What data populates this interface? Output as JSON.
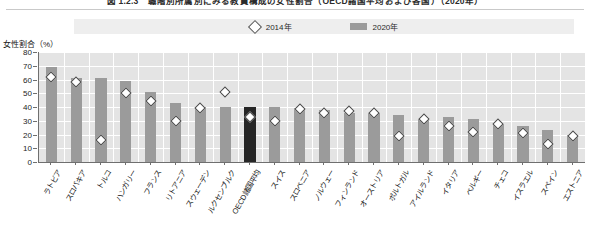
{
  "figure": {
    "title": "図 1.2.3　職階別所属別にみる教員構成の女性割合（OECD諸国平均および各国）（2020年）",
    "y_axis_title": "女性割合（%）"
  },
  "legend": {
    "position": "top-center",
    "items": [
      {
        "label": "2014年",
        "marker": "diamond-outline-icon",
        "color": "#ffffff"
      },
      {
        "label": "2020年",
        "marker": "bar-swatch-icon",
        "color": "#9b9b9b"
      }
    ]
  },
  "colors": {
    "bar": "#9b9b9b",
    "bar_highlight": "#262626",
    "marker_fill": "#ffffff",
    "marker_stroke": "#4a4a4a",
    "plot_background": "#e4e4e4",
    "gridline": "#ffffff",
    "axis": "#6f6f6f",
    "legend_background": "#eeeeee"
  },
  "chart_data": {
    "type": "bar",
    "title": "図 1.2.3　職階別所属別にみる教員構成の女性割合（OECD諸国平均および各国）（2020年）",
    "xlabel": "",
    "ylabel": "女性割合（%）",
    "ylim": [
      0,
      80
    ],
    "yticks": [
      0,
      10,
      20,
      30,
      40,
      50,
      60,
      70,
      80
    ],
    "grid": true,
    "legend_position": "top-center",
    "highlight_category": "OECD諸国平均",
    "categories": [
      "ラトビア",
      "スロバキア",
      "トルコ",
      "ハンガリー",
      "フランス",
      "リトアニア",
      "スウェーデン",
      "ルクセンブルク",
      "OECD諸国平均",
      "スイス",
      "スロベニア",
      "ノルウェー",
      "フィンランド",
      "オーストリア",
      "ポルトガル",
      "アイルランド",
      "イタリア",
      "ベルギー",
      "チェコ",
      "イスラエル",
      "スペイン",
      "エストニア"
    ],
    "series": [
      {
        "name": "2020年",
        "type": "bar",
        "values": [
          69,
          61,
          61,
          59,
          51,
          43,
          40,
          40,
          40,
          40,
          39,
          38,
          36,
          36,
          34,
          31,
          33,
          31,
          28,
          26,
          23,
          20
        ]
      },
      {
        "name": "2014年",
        "type": "scatter",
        "marker": "diamond",
        "values": [
          62,
          58,
          16,
          50,
          44.5,
          29.5,
          39,
          51,
          33,
          29.5,
          38.5,
          36,
          37,
          36,
          19,
          31,
          26,
          22,
          28,
          21,
          13,
          19
        ]
      }
    ]
  }
}
